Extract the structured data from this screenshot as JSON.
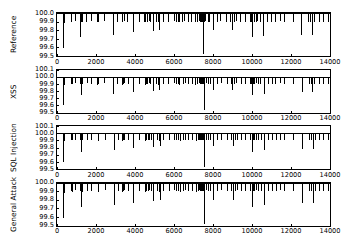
{
  "chart_data": {
    "type": "line",
    "title": "",
    "xlabel": "",
    "ylabel": "",
    "grid": false,
    "legend": null,
    "xlim": [
      0,
      14000
    ],
    "xticks": [
      "0",
      "2000",
      "4000",
      "6000",
      "8000",
      "10000",
      "12000",
      "14000"
    ],
    "xtick_values": [
      0,
      2000,
      4000,
      6000,
      8000,
      10000,
      12000,
      14000
    ],
    "panels": [
      {
        "name": "Reference",
        "ylabel": "Reference",
        "ylim": [
          99.5,
          100.0
        ],
        "yticks": [
          "100.0",
          "99.9",
          "99.8",
          "99.7",
          "99.6",
          "99.5"
        ],
        "ytick_values": [
          100.0,
          99.9,
          99.8,
          99.7,
          99.6,
          99.5
        ],
        "baseline": 100.0,
        "x": [
          330,
          360,
          700,
          740,
          900,
          1180,
          1200,
          1230,
          1260,
          1500,
          1720,
          2060,
          2080,
          2400,
          2860,
          2890,
          3080,
          3330,
          3350,
          3420,
          3600,
          3880,
          4180,
          4480,
          4520,
          4620,
          4700,
          4760,
          4900,
          5080,
          5180,
          5220,
          5420,
          5680,
          5980,
          6080,
          6180,
          6250,
          6420,
          6520,
          6700,
          6880,
          7080,
          7180,
          7280,
          7320,
          7380,
          7420,
          7480,
          7520,
          7600,
          7720,
          7820,
          7980,
          8180,
          8380,
          8680,
          8880,
          8960,
          9080,
          9180,
          9400,
          9620,
          9880,
          9960,
          10020,
          10080,
          10180,
          10280,
          10400,
          10580,
          10780,
          10980,
          11180,
          11420,
          11620,
          12080,
          12520,
          12880,
          12980,
          13080,
          13180,
          13420,
          13620,
          13880
        ],
        "y": [
          99.59,
          99.88,
          99.9,
          99.89,
          99.91,
          99.9,
          99.72,
          99.89,
          99.9,
          99.9,
          99.91,
          99.89,
          99.9,
          99.91,
          99.9,
          99.74,
          99.9,
          99.89,
          99.9,
          99.91,
          99.9,
          99.78,
          99.9,
          99.89,
          99.9,
          99.9,
          99.91,
          99.9,
          99.79,
          99.9,
          99.89,
          99.8,
          99.9,
          99.9,
          99.91,
          99.9,
          99.9,
          99.89,
          99.9,
          99.91,
          99.9,
          99.9,
          99.89,
          99.9,
          99.91,
          99.9,
          99.9,
          99.9,
          99.52,
          99.9,
          99.91,
          99.9,
          99.9,
          99.8,
          99.9,
          99.91,
          99.9,
          99.9,
          99.8,
          99.9,
          99.91,
          99.9,
          99.9,
          99.9,
          99.9,
          99.72,
          99.9,
          99.9,
          99.91,
          99.9,
          99.73,
          99.9,
          99.9,
          99.9,
          99.91,
          99.9,
          99.9,
          99.74,
          99.9,
          99.9,
          99.75,
          99.9,
          99.9,
          99.9,
          99.9
        ]
      },
      {
        "name": "XSS",
        "ylabel": "XSS",
        "ylim": [
          99.5,
          100.1
        ],
        "yticks": [
          "100.1",
          "100.0",
          "99.9",
          "99.8",
          "99.7",
          "99.6",
          "99.5"
        ],
        "ytick_values": [
          100.1,
          100.0,
          99.9,
          99.8,
          99.7,
          99.6,
          99.5
        ],
        "baseline": 100.0,
        "x": [
          330,
          360,
          700,
          760,
          900,
          1180,
          1220,
          1260,
          1520,
          1740,
          2060,
          2100,
          2420,
          2880,
          3100,
          3340,
          3380,
          3440,
          3620,
          3900,
          4200,
          4500,
          4540,
          4640,
          4720,
          4780,
          4920,
          5100,
          5200,
          5240,
          5440,
          5700,
          6000,
          6100,
          6200,
          6270,
          6440,
          6540,
          6720,
          6900,
          7100,
          7200,
          7300,
          7340,
          7380,
          7420,
          7460,
          7500,
          7540,
          7620,
          7740,
          7840,
          8000,
          8200,
          8400,
          8700,
          8900,
          8980,
          9100,
          9200,
          9420,
          9640,
          9900,
          9960,
          10000,
          10040,
          10100,
          10200,
          10300,
          10420,
          10600,
          10800,
          11000,
          11200,
          11440,
          11640,
          12100,
          12540,
          12900,
          13000,
          13100,
          13200,
          13440,
          13640,
          13900
        ],
        "y": [
          99.6,
          99.89,
          99.9,
          99.9,
          99.91,
          99.9,
          99.74,
          99.9,
          99.91,
          99.9,
          99.89,
          99.9,
          99.91,
          99.76,
          99.9,
          99.89,
          99.9,
          99.91,
          99.9,
          99.78,
          99.9,
          99.89,
          99.9,
          99.9,
          99.91,
          99.9,
          99.8,
          99.9,
          99.89,
          99.82,
          99.9,
          99.9,
          99.91,
          99.9,
          99.9,
          99.89,
          99.9,
          99.91,
          99.9,
          99.9,
          99.89,
          99.9,
          99.91,
          99.9,
          99.9,
          99.9,
          99.91,
          99.9,
          99.53,
          99.91,
          99.9,
          99.9,
          99.82,
          99.9,
          99.91,
          99.9,
          99.9,
          99.82,
          99.9,
          99.91,
          99.9,
          99.9,
          99.9,
          99.9,
          99.74,
          99.9,
          99.9,
          99.91,
          99.9,
          99.9,
          99.76,
          99.9,
          99.9,
          99.9,
          99.91,
          99.9,
          99.9,
          99.78,
          99.9,
          99.9,
          99.78,
          99.9,
          99.9,
          99.9,
          99.9
        ]
      },
      {
        "name": "SQL Injection",
        "ylabel": "SQL Injection",
        "ylim": [
          99.5,
          100.1
        ],
        "yticks": [
          "100.1",
          "100.0",
          "99.9",
          "99.8",
          "99.7",
          "99.6",
          "99.5"
        ],
        "ytick_values": [
          100.1,
          100.0,
          99.9,
          99.8,
          99.7,
          99.6,
          99.5
        ],
        "baseline": 100.0,
        "x": [
          330,
          360,
          700,
          760,
          920,
          1180,
          1220,
          1280,
          1520,
          1760,
          2080,
          2120,
          2440,
          2900,
          3120,
          3340,
          3400,
          3460,
          3640,
          3920,
          4220,
          4520,
          4560,
          4660,
          4740,
          4800,
          4940,
          5120,
          5220,
          5260,
          5460,
          5720,
          6020,
          6120,
          6220,
          6290,
          6460,
          6560,
          6740,
          6920,
          7120,
          7220,
          7300,
          7340,
          7380,
          7420,
          7460,
          7500,
          7560,
          7640,
          7760,
          7860,
          8020,
          8220,
          8420,
          8720,
          8920,
          9000,
          9120,
          9220,
          9440,
          9660,
          9920,
          9980,
          10020,
          10060,
          10120,
          10220,
          10320,
          10440,
          10620,
          10820,
          11020,
          11220,
          11460,
          11660,
          12120,
          12560,
          12920,
          13020,
          13120,
          13220,
          13460,
          13660,
          13920
        ],
        "y": [
          99.6,
          99.89,
          99.9,
          99.9,
          99.91,
          99.9,
          99.74,
          99.9,
          99.91,
          99.9,
          99.89,
          99.9,
          99.91,
          99.76,
          99.9,
          99.89,
          99.9,
          99.91,
          99.9,
          99.79,
          99.9,
          99.89,
          99.9,
          99.9,
          99.91,
          99.9,
          99.8,
          99.9,
          99.89,
          99.82,
          99.9,
          99.9,
          99.91,
          99.9,
          99.9,
          99.89,
          99.9,
          99.91,
          99.9,
          99.9,
          99.89,
          99.9,
          99.91,
          99.9,
          99.9,
          99.9,
          99.91,
          99.9,
          99.53,
          99.91,
          99.9,
          99.9,
          99.82,
          99.9,
          99.91,
          99.9,
          99.9,
          99.82,
          99.9,
          99.91,
          99.9,
          99.9,
          99.9,
          99.9,
          99.74,
          99.9,
          99.9,
          99.91,
          99.9,
          99.9,
          99.76,
          99.9,
          99.9,
          99.9,
          99.91,
          99.9,
          99.9,
          99.78,
          99.9,
          99.9,
          99.78,
          99.9,
          99.9,
          99.9,
          99.9
        ]
      },
      {
        "name": "General Attack",
        "ylabel": "General Attack",
        "ylim": [
          99.5,
          100.0
        ],
        "yticks": [
          "100.0",
          "99.9",
          "99.8",
          "99.7",
          "99.6",
          "99.5"
        ],
        "ytick_values": [
          100.0,
          99.9,
          99.8,
          99.7,
          99.6,
          99.5
        ],
        "baseline": 100.0,
        "x": [
          330,
          360,
          700,
          760,
          920,
          1180,
          1220,
          1280,
          1520,
          1760,
          2080,
          2120,
          2440,
          2900,
          3120,
          3340,
          3400,
          3460,
          3640,
          3920,
          4220,
          4520,
          4560,
          4660,
          4740,
          4800,
          4940,
          5120,
          5220,
          5260,
          5460,
          5720,
          6020,
          6120,
          6220,
          6290,
          6460,
          6560,
          6740,
          6920,
          7120,
          7220,
          7300,
          7340,
          7380,
          7420,
          7460,
          7500,
          7560,
          7640,
          7760,
          7860,
          8020,
          8220,
          8420,
          8720,
          8920,
          9000,
          9120,
          9220,
          9440,
          9660,
          9920,
          9980,
          10020,
          10060,
          10120,
          10220,
          10320,
          10440,
          10620,
          10820,
          11020,
          11220,
          11460,
          11660,
          12120,
          12560,
          12920,
          13020,
          13120,
          13220,
          13460,
          13660,
          13920
        ],
        "y": [
          99.59,
          99.88,
          99.9,
          99.89,
          99.91,
          99.9,
          99.72,
          99.89,
          99.9,
          99.9,
          99.89,
          99.9,
          99.91,
          99.74,
          99.9,
          99.89,
          99.9,
          99.91,
          99.9,
          99.76,
          99.9,
          99.89,
          99.9,
          99.9,
          99.91,
          99.9,
          99.78,
          99.9,
          99.89,
          99.8,
          99.9,
          99.9,
          99.91,
          99.9,
          99.9,
          99.89,
          99.9,
          99.91,
          99.9,
          99.9,
          99.89,
          99.9,
          99.91,
          99.9,
          99.9,
          99.9,
          99.91,
          99.9,
          99.52,
          99.91,
          99.9,
          99.9,
          99.8,
          99.9,
          99.91,
          99.9,
          99.9,
          99.8,
          99.9,
          99.91,
          99.9,
          99.9,
          99.9,
          99.9,
          99.72,
          99.9,
          99.9,
          99.91,
          99.9,
          99.9,
          99.74,
          99.9,
          99.9,
          99.9,
          99.91,
          99.9,
          99.9,
          99.76,
          99.9,
          99.9,
          99.76,
          99.9,
          99.9,
          99.9,
          99.9
        ]
      }
    ],
    "style": {
      "line_color": "#000000",
      "background": "#ffffff",
      "axis_color": "#000000"
    }
  }
}
